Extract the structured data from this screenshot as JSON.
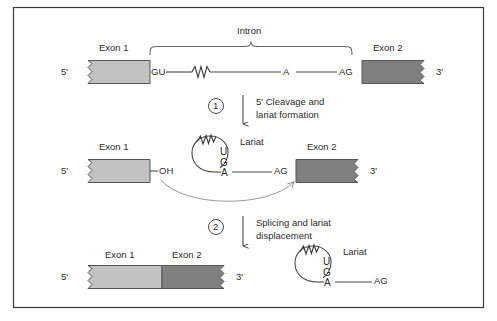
{
  "figure": {
    "title_alt": "RNA splicing: two-step lariat mechanism",
    "border_color": "#3a3a3a",
    "background": "#ffffff",
    "line_color": "#4a4a4a",
    "text_color": "#2b2b2b",
    "exon1_color": "#c2c2c2",
    "exon2_color": "#808080"
  },
  "row1": {
    "intron_label": "Intron",
    "exon1_label": "Exon 1",
    "exon2_label": "Exon 2",
    "five_prime": "5'",
    "three_prime": "3'",
    "donor_site": "GU",
    "branch_point": "A",
    "acceptor_site": "AG"
  },
  "step1": {
    "number": "1",
    "line1": "5' Cleavage and",
    "line2": "lariat formation"
  },
  "row2": {
    "exon1_label": "Exon 1",
    "exon2_label": "Exon 2",
    "five_prime": "5'",
    "three_prime": "3'",
    "hydroxyl": "OH",
    "lariat_label": "Lariat",
    "base_u": "U",
    "base_g": "G",
    "base_a": "A",
    "acceptor_site": "AG"
  },
  "step2": {
    "number": "2",
    "line1": "Splicing and lariat",
    "line2": "displacement"
  },
  "row3": {
    "exon1_label": "Exon 1",
    "exon2_label": "Exon 2",
    "five_prime": "5'",
    "three_prime": "3'",
    "lariat_label": "Lariat",
    "base_u": "U",
    "base_g": "G",
    "base_a": "A",
    "acceptor_site": "AG"
  }
}
